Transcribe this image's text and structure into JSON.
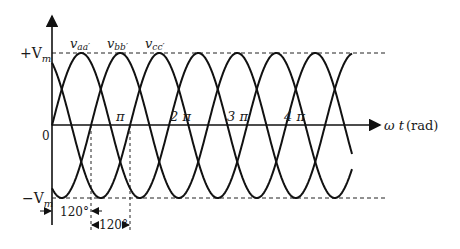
{
  "chart_data": {
    "type": "line",
    "xlabel": "ωt (rad)",
    "ylabel": "",
    "y_ticks": [
      "+V_m",
      "0",
      "-V_m"
    ],
    "x_ticks": [
      "π",
      "2π",
      "3π",
      "4π"
    ],
    "series": [
      {
        "name": "v_aa'",
        "phase_deg": 0,
        "peak_deg": 90
      },
      {
        "name": "v_bb'",
        "phase_deg": -120,
        "peak_deg": 210
      },
      {
        "name": "v_cc'",
        "phase_deg": 120,
        "peak_deg": 330
      }
    ],
    "amplitude": "V_m",
    "x_range_rad": [
      0,
      15.5
    ],
    "annotations": [
      "120°",
      "120°"
    ],
    "reference_lines": [
      "+V_m dashed",
      "-V_m dashed"
    ]
  },
  "labels": {
    "plus_vm": "+V",
    "plus_vm_sub": "m",
    "minus_vm": "−V",
    "minus_vm_sub": "m",
    "zero": "0",
    "pi": "π",
    "two_pi": "2 π",
    "three_pi": "3 π",
    "four_pi": "4 π",
    "x_axis_omega": "ω t",
    "x_axis_unit": "(rad)",
    "series_a": "v",
    "series_a_sub": "aa′",
    "series_b": "v",
    "series_b_sub": "bb′",
    "series_c": "v",
    "series_c_sub": "cc′",
    "dim1": "120°",
    "dim2": "120°"
  }
}
